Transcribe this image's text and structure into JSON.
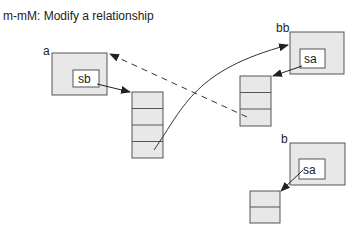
{
  "title": "m-mM: Modify a relationship",
  "colors": {
    "box_fill": "#e8e8e8",
    "stroke": "#555555",
    "inner_fill": "#ffffff",
    "line": "#333333"
  },
  "objects": [
    {
      "label": "a",
      "slot": "sb"
    },
    {
      "label": "bb",
      "slot": "sa"
    },
    {
      "label": "b",
      "slot": "sa"
    }
  ],
  "stacks": [
    {
      "owner": "a",
      "cells": 4
    },
    {
      "owner": "bb",
      "cells": 3
    },
    {
      "owner": "b",
      "cells": 2
    }
  ],
  "edges": [
    {
      "from": "a.sb",
      "to": "stack-a",
      "style": "solid-arrow"
    },
    {
      "from": "stack-bb.cell-3",
      "to": "a",
      "style": "dashed-arrow"
    },
    {
      "from": "stack-a.cell-4",
      "to": "bb",
      "style": "curved-arrow"
    },
    {
      "from": "bb.sa",
      "to": "stack-bb",
      "style": "solid-arrow"
    },
    {
      "from": "b.sa",
      "to": "stack-b",
      "style": "solid-arrow"
    }
  ]
}
